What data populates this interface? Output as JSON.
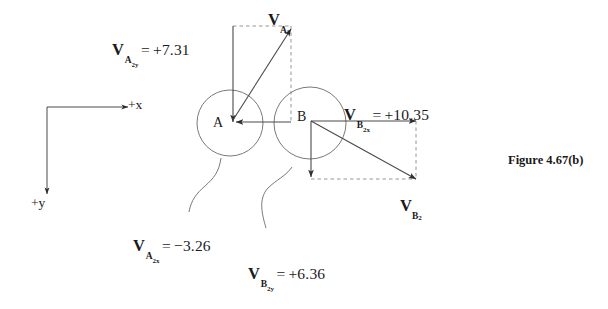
{
  "figure": {
    "caption": "Figure 4.67(b)",
    "background_color": "#ffffff",
    "ink_color": "#3a3a3a",
    "text_color": "#1a1a1a",
    "width": 608,
    "height": 309
  },
  "axes": {
    "x_label": "+x",
    "y_label": "+y",
    "origin": {
      "x": 47,
      "y": 107
    },
    "x_tip": {
      "x": 128,
      "y": 107
    },
    "y_tip": {
      "x": 47,
      "y": 194
    }
  },
  "nodes": [
    {
      "id": "A",
      "label": "A",
      "cx": 230,
      "cy": 123,
      "r": 33,
      "label_x": 213,
      "label_y": 123
    },
    {
      "id": "B",
      "label": "B",
      "cx": 310,
      "cy": 123,
      "r": 36,
      "label_x": 297,
      "label_y": 117
    }
  ],
  "vectors": {
    "A2": {
      "name_symbol": "V",
      "name_sub": "A",
      "name_subsub": "2",
      "label_x": 268,
      "label_y": 12,
      "tail": {
        "x": 233,
        "y": 120
      },
      "head": {
        "x": 291,
        "y": 29
      }
    },
    "B2": {
      "name_symbol": "V",
      "name_sub": "B",
      "name_subsub": "2",
      "label_x": 400,
      "label_y": 198,
      "tail": {
        "x": 311,
        "y": 121
      },
      "head": {
        "x": 416,
        "y": 179
      }
    }
  },
  "components": {
    "A2y": {
      "symbol": "V",
      "sub": "A",
      "subsub": "2",
      "subaxis": "y",
      "operator": "=",
      "value": "+7.31",
      "label_x": 112,
      "label_y": 42,
      "tail": {
        "x": 233,
        "y": 26
      },
      "head": {
        "x": 233,
        "y": 122
      }
    },
    "A2x": {
      "symbol": "V",
      "sub": "A",
      "subsub": "2",
      "subaxis": "x",
      "operator": "=",
      "value": "−3.26",
      "label_x": 133,
      "label_y": 238,
      "tail": {
        "x": 291,
        "y": 122
      },
      "head": {
        "x": 235,
        "y": 122
      }
    },
    "B2x": {
      "symbol": "V",
      "sub": "B",
      "subsub": "2",
      "subaxis": "x",
      "operator": "=",
      "value": "+10.35",
      "label_x": 344,
      "label_y": 107,
      "tail": {
        "x": 311,
        "y": 121
      },
      "head": {
        "x": 416,
        "y": 121
      }
    },
    "B2y": {
      "symbol": "V",
      "sub": "B",
      "subsub": "2",
      "subaxis": "y",
      "operator": "=",
      "value": "+6.36",
      "label_x": 248,
      "label_y": 266,
      "tail": {
        "x": 311,
        "y": 121
      },
      "head": {
        "x": 311,
        "y": 177
      }
    }
  },
  "construction_lines": {
    "a2_top_dashed": {
      "x1": 233,
      "y1": 26,
      "x2": 291,
      "y2": 26
    },
    "a2_right_dashed": {
      "x1": 291,
      "y1": 26,
      "x2": 291,
      "y2": 122
    },
    "b2_right_dashed": {
      "x1": 416,
      "y1": 121,
      "x2": 416,
      "y2": 179
    },
    "b2_bottom_dashed": {
      "x1": 311,
      "y1": 179,
      "x2": 416,
      "y2": 179
    }
  },
  "leader_curves": [
    {
      "id": "leader-to-a2x",
      "path": "M 221,158 C 219,172 214,178 205,186 C 197,193 191,200 189,212"
    },
    {
      "id": "leader-to-b2y",
      "path": "M 292,167 C 286,176 276,180 268,188 C 258,199 262,214 266,228"
    }
  ]
}
